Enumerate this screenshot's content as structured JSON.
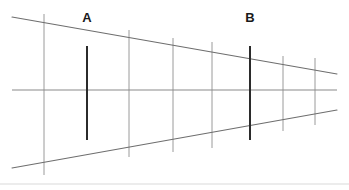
{
  "figure": {
    "type": "ponzo-illusion-diagram",
    "canvas": {
      "width": 349,
      "height": 190,
      "background": "#ffffff"
    },
    "colors": {
      "converging_line": "#6e6e6e",
      "horizontal_line": "#8a8a8a",
      "rung_line": "#9a9a9a",
      "test_bar": "#2b2b2b",
      "label_text": "#1a1a1a",
      "footer_divider": "#d9d9d9"
    },
    "labels": [
      {
        "id": "label-a",
        "text": "A",
        "x": 87,
        "y": 17
      },
      {
        "id": "label-b",
        "text": "B",
        "x": 250,
        "y": 17
      }
    ],
    "converging_lines": [
      {
        "id": "upper-converging-line",
        "x1": 12,
        "y1": 17,
        "x2": 337,
        "y2": 74,
        "width": 1.15
      },
      {
        "id": "lower-converging-line",
        "x1": 12,
        "y1": 168,
        "x2": 337,
        "y2": 110,
        "width": 1.15
      }
    ],
    "horizontal_line": {
      "id": "center-horizontal-line",
      "x1": 12,
      "y1": 90,
      "x2": 337,
      "y2": 90,
      "width": 1.1
    },
    "rungs": [
      {
        "id": "rung-1",
        "x": 44,
        "y1": 14,
        "y2": 175,
        "width": 1.0
      },
      {
        "id": "rung-2",
        "x": 129,
        "y1": 30,
        "y2": 157,
        "width": 1.0
      },
      {
        "id": "rung-3",
        "x": 173,
        "y1": 38,
        "y2": 152,
        "width": 1.0
      },
      {
        "id": "rung-4",
        "x": 212,
        "y1": 42,
        "y2": 148,
        "width": 1.0
      },
      {
        "id": "rung-5",
        "x": 283,
        "y1": 56,
        "y2": 131,
        "width": 1.0
      },
      {
        "id": "rung-6",
        "x": 315,
        "y1": 58,
        "y2": 125,
        "width": 1.0
      }
    ],
    "test_bars": [
      {
        "id": "bar-a",
        "label": "A",
        "x": 87,
        "y1": 46,
        "y2": 140,
        "width": 2.0,
        "length_px": 94
      },
      {
        "id": "bar-b",
        "label": "B",
        "x": 250,
        "y1": 46,
        "y2": 140,
        "width": 2.0,
        "length_px": 94
      }
    ],
    "footer_divider": {
      "id": "footer-divider",
      "x1": 0,
      "y1": 184,
      "x2": 349,
      "y2": 184,
      "width": 1.0
    }
  }
}
